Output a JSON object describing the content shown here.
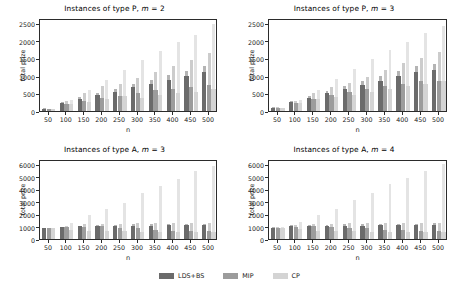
{
  "figure": {
    "width": 459,
    "height": 292,
    "background": "#ffffff"
  },
  "legend": {
    "position": "bottom-center",
    "entries": [
      {
        "label": "LDS+BS",
        "color": "#6b6b6b"
      },
      {
        "label": "MIP",
        "color": "#9c9c9c"
      },
      {
        "label": "CP",
        "color": "#d4d4d4"
      }
    ]
  },
  "series_colors": {
    "LDS+BS": "#6b6b6b",
    "MIP": "#9c9c9c",
    "CP": "#d4d4d4",
    "error_LDS+BS": "#b4b4b4",
    "error_MIP": "#cccccc",
    "error_CP": "#e4e4e4"
  },
  "chart_data": [
    {
      "type": "bar",
      "title": "Instances of type P, m = 2",
      "xlabel": "n",
      "ylabel": "total prize",
      "grid": false,
      "legend": "bottom",
      "categories": [
        "50",
        "100",
        "150",
        "200",
        "250",
        "300",
        "350",
        "400",
        "450",
        "500"
      ],
      "ylim": [
        0,
        2650
      ],
      "yticks": [
        0,
        500,
        1000,
        1500,
        2000,
        2500
      ],
      "series": [
        {
          "name": "LDS+BS",
          "values": [
            60,
            225,
            335,
            450,
            555,
            675,
            770,
            885,
            1000,
            1100
          ],
          "err_high": [
            75,
            260,
            390,
            520,
            640,
            780,
            890,
            1020,
            1150,
            1270
          ]
        },
        {
          "name": "MIP",
          "values": [
            55,
            205,
            295,
            385,
            440,
            525,
            605,
            635,
            690,
            730
          ],
          "err_high": [
            70,
            290,
            500,
            700,
            775,
            940,
            1120,
            1290,
            1440,
            1665
          ]
        },
        {
          "name": "CP",
          "values": [
            50,
            210,
            270,
            330,
            435,
            370,
            450,
            520,
            555,
            620
          ],
          "err_high": [
            65,
            300,
            590,
            890,
            1165,
            1440,
            1710,
            1965,
            2180,
            2490
          ]
        }
      ]
    },
    {
      "type": "bar",
      "title": "Instances of type P, m = 3",
      "xlabel": "n",
      "ylabel": "total prize",
      "grid": false,
      "legend": "bottom",
      "categories": [
        "50",
        "100",
        "150",
        "200",
        "250",
        "300",
        "350",
        "400",
        "450",
        "500"
      ],
      "ylim": [
        0,
        2650
      ],
      "yticks": [
        0,
        500,
        1000,
        1500,
        2000,
        2500
      ],
      "series": [
        {
          "name": "LDS+BS",
          "values": [
            95,
            250,
            385,
            500,
            625,
            740,
            865,
            995,
            1120,
            1160
          ],
          "err_high": [
            115,
            290,
            440,
            570,
            715,
            850,
            990,
            1140,
            1280,
            1330
          ]
        },
        {
          "name": "MIP",
          "values": [
            85,
            235,
            345,
            460,
            535,
            625,
            710,
            775,
            855,
            865
          ],
          "err_high": [
            105,
            280,
            500,
            690,
            800,
            960,
            1180,
            1360,
            1500,
            1690
          ]
        },
        {
          "name": "CP",
          "values": [
            80,
            225,
            330,
            410,
            470,
            540,
            620,
            700,
            780,
            860
          ],
          "err_high": [
            100,
            300,
            610,
            900,
            1185,
            1470,
            1725,
            1960,
            2215,
            2415
          ]
        }
      ]
    },
    {
      "type": "bar",
      "title": "Instances of type A, m = 3",
      "xlabel": "n",
      "ylabel": "total prize",
      "grid": false,
      "legend": "bottom",
      "categories": [
        "50",
        "100",
        "150",
        "200",
        "250",
        "300",
        "350",
        "400",
        "450",
        "500"
      ],
      "ylim": [
        0,
        6400
      ],
      "yticks": [
        0,
        1000,
        2000,
        3000,
        4000,
        5000,
        6000
      ],
      "series": [
        {
          "name": "LDS+BS",
          "values": [
            880,
            945,
            1010,
            1060,
            1040,
            1075,
            1080,
            1085,
            1090,
            1095
          ],
          "err_high": [
            900,
            990,
            1080,
            1140,
            1120,
            1170,
            1175,
            1180,
            1185,
            1190
          ]
        },
        {
          "name": "MIP",
          "values": [
            875,
            930,
            975,
            1005,
            890,
            890,
            760,
            640,
            605,
            620
          ],
          "err_high": [
            900,
            1060,
            1170,
            1235,
            1215,
            1250,
            1265,
            1280,
            1285,
            1290
          ]
        },
        {
          "name": "CP",
          "values": [
            870,
            760,
            650,
            645,
            615,
            580,
            590,
            575,
            570,
            565
          ],
          "err_high": [
            905,
            1305,
            1890,
            2400,
            2900,
            3665,
            4230,
            4790,
            5440,
            5880
          ]
        }
      ]
    },
    {
      "type": "bar",
      "title": "Instances of type A, m = 4",
      "xlabel": "n",
      "ylabel": "total prize",
      "grid": false,
      "legend": "bottom",
      "categories": [
        "50",
        "100",
        "150",
        "200",
        "250",
        "300",
        "350",
        "400",
        "450",
        "500"
      ],
      "ylim": [
        0,
        6400
      ],
      "yticks": [
        0,
        1000,
        2000,
        3000,
        4000,
        5000,
        6000
      ],
      "series": [
        {
          "name": "LDS+BS",
          "values": [
            915,
            1020,
            1060,
            1070,
            1075,
            1080,
            1110,
            1115,
            1120,
            1130
          ],
          "err_high": [
            940,
            1090,
            1140,
            1155,
            1165,
            1175,
            1215,
            1220,
            1230,
            1250
          ]
        },
        {
          "name": "MIP",
          "values": [
            900,
            980,
            1010,
            990,
            905,
            855,
            760,
            700,
            670,
            660
          ],
          "err_high": [
            930,
            1150,
            1215,
            1240,
            1255,
            1265,
            1290,
            1300,
            1305,
            1320
          ]
        },
        {
          "name": "CP",
          "values": [
            890,
            780,
            680,
            655,
            620,
            595,
            600,
            590,
            570,
            575
          ],
          "err_high": [
            930,
            1375,
            1905,
            2420,
            3090,
            3665,
            4390,
            4905,
            5470,
            5990
          ]
        }
      ]
    }
  ]
}
